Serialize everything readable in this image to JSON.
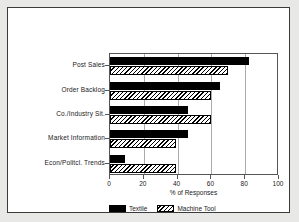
{
  "chart_data": {
    "type": "bar",
    "orientation": "horizontal",
    "title": "",
    "xlabel": "% of Responses",
    "ylabel": "",
    "xlim": [
      0,
      100
    ],
    "xticks": [
      0,
      20,
      40,
      60,
      80,
      100
    ],
    "grid": true,
    "legend_position": "bottom",
    "categories": [
      "Post Sales",
      "Order Backlog",
      "Co./Industry Sit.",
      "Market Information",
      "Econ/Politcl. Trends"
    ],
    "series": [
      {
        "name": "Textile",
        "fill": "solid",
        "color": "#000000",
        "values": [
          82,
          65,
          46,
          46,
          9
        ]
      },
      {
        "name": "Machine Tool",
        "fill": "hatch",
        "color": "#000000",
        "values": [
          70,
          60,
          60,
          39,
          39
        ]
      }
    ]
  },
  "legend": {
    "entries": [
      {
        "label": "Textile"
      },
      {
        "label": "Machine Tool"
      }
    ]
  }
}
